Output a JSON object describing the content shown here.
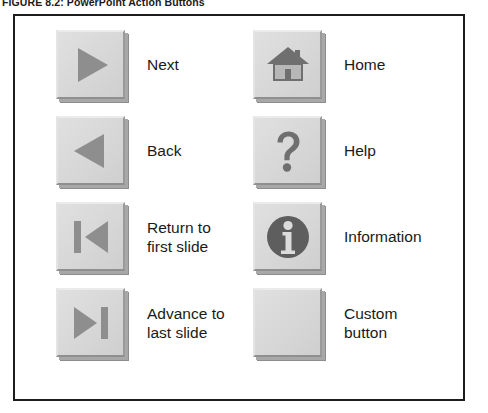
{
  "caption": {
    "label": "FIGURE 8.2:",
    "title": "PowerPoint Action Buttons"
  },
  "colors": {
    "button_face": "#d9d9d9",
    "button_highlight": "#ebebeb",
    "button_shadow": "#8d8d8d",
    "glyph_gray": "#8e8e8e",
    "glyph_dark": "#6f6f6f",
    "frame_border": "#1c1c1c",
    "text": "#1a1a1a",
    "background": "#ffffff"
  },
  "figure": {
    "buttons": [
      {
        "id": "next",
        "icon": "triangle-right-icon",
        "label": "Next",
        "column": "left",
        "row": 1
      },
      {
        "id": "back",
        "icon": "triangle-left-icon",
        "label": "Back",
        "column": "left",
        "row": 2
      },
      {
        "id": "first-slide",
        "icon": "skip-to-start-icon",
        "label": "Return to\nfirst slide",
        "column": "left",
        "row": 3
      },
      {
        "id": "last-slide",
        "icon": "skip-to-end-icon",
        "label": "Advance to\nlast slide",
        "column": "left",
        "row": 4
      },
      {
        "id": "home",
        "icon": "house-icon",
        "label": "Home",
        "column": "right",
        "row": 1
      },
      {
        "id": "help",
        "icon": "question-mark-icon",
        "label": "Help",
        "column": "right",
        "row": 2
      },
      {
        "id": "information",
        "icon": "information-circle-icon",
        "label": "Information",
        "column": "right",
        "row": 3
      },
      {
        "id": "custom",
        "icon": "blank-icon",
        "label": "Custom\nbutton",
        "column": "right",
        "row": 4
      }
    ]
  }
}
